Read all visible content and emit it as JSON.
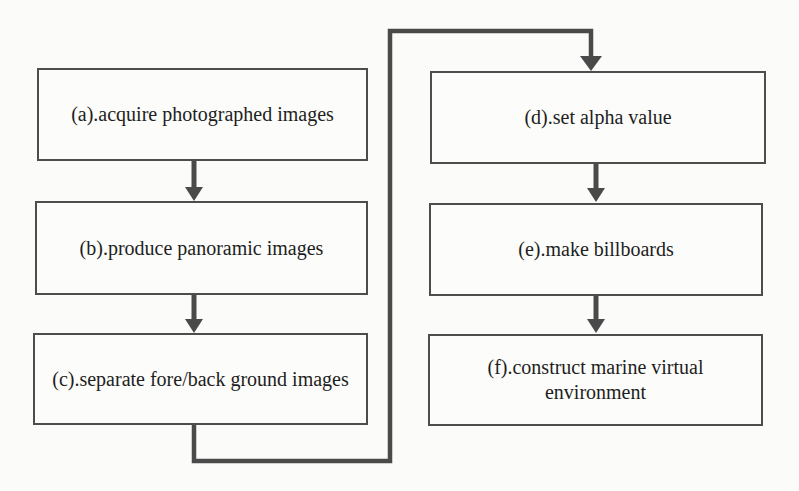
{
  "diagram": {
    "type": "flowchart",
    "boxes": [
      {
        "id": "a",
        "label": "(a).acquire photographed images"
      },
      {
        "id": "b",
        "label": "(b).produce panoramic images"
      },
      {
        "id": "c",
        "label": "(c).separate fore/back ground images"
      },
      {
        "id": "d",
        "label": "(d).set alpha value"
      },
      {
        "id": "e",
        "label": "(e).make billboards"
      },
      {
        "id": "f",
        "label": "(f).construct marine virtual environment"
      }
    ],
    "connections": [
      {
        "from": "a",
        "to": "b",
        "style": "straight-arrow-down"
      },
      {
        "from": "b",
        "to": "c",
        "style": "straight-arrow-down"
      },
      {
        "from": "c",
        "to": "d",
        "style": "routed-down-right-up-across-down"
      },
      {
        "from": "d",
        "to": "e",
        "style": "straight-arrow-down"
      },
      {
        "from": "e",
        "to": "f",
        "style": "straight-arrow-down"
      }
    ],
    "colors": {
      "background": "#fbfbf9",
      "box_fill": "#fcfcfa",
      "box_border": "#4d4d4d",
      "line": "#4a4a4a",
      "text": "#1e1e1e"
    }
  }
}
